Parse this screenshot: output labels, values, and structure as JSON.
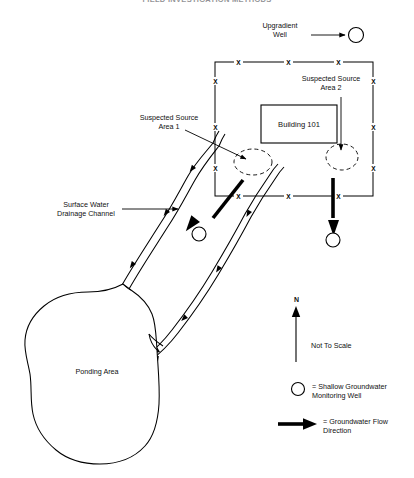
{
  "header": {
    "title": "FIELD INVESTIGATION METHODS"
  },
  "diagram": {
    "labels": {
      "upgradient_well": "Upgradient\nWell",
      "suspected_source_area_2": "Suspected Source\nArea 2",
      "suspected_source_area_1": "Suspected Source\nArea 1",
      "building": "Building 101",
      "surface_water_channel": "Surface Water\nDrainage Channel",
      "ponding_area": "Ponding Area",
      "north": "N",
      "scale_note": "Not To Scale"
    },
    "legend": [
      {
        "symbol": "open-circle",
        "text": "= Shallow Groundwater\nMonitoring Well"
      },
      {
        "symbol": "thick-arrow",
        "text": "= Groundwater Flow\nDirection"
      }
    ],
    "features": {
      "fence_mark": "X",
      "fence_mark_count": 12,
      "monitoring_well_count": 3,
      "groundwater_flow_arrow_count": 2,
      "suspected_source_area_count": 2
    },
    "colors": {
      "line": "#000000",
      "text": "#111111",
      "background": "#ffffff"
    }
  }
}
